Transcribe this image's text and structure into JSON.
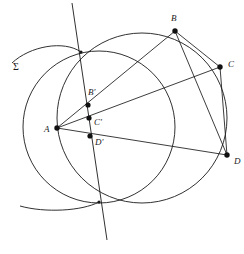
{
  "figure": {
    "width": 244,
    "height": 254,
    "stroke_color": "#1a1a1a",
    "background_color": "#ffffff",
    "point_color": "#111111"
  },
  "labels": {
    "sigma": "Σ",
    "A": "A",
    "B": "B",
    "C": "C",
    "D": "D",
    "Bp": "B'",
    "Cp": "C'",
    "Dp": "D'"
  },
  "points": {
    "A": {
      "x": 57,
      "y": 128,
      "label": "A",
      "label_x": 44,
      "label_y": 125,
      "marked": true
    },
    "B": {
      "x": 175,
      "y": 31,
      "label": "B",
      "label_x": 171,
      "label_y": 14,
      "marked": true
    },
    "C": {
      "x": 220,
      "y": 67,
      "label": "C",
      "label_x": 228,
      "label_y": 60,
      "marked": true
    },
    "D": {
      "x": 227,
      "y": 155,
      "label": "D",
      "label_x": 234,
      "label_y": 157,
      "marked": true
    },
    "Bp": {
      "x": 88,
      "y": 105,
      "label": "B'",
      "label_x": 88,
      "label_y": 88,
      "marked": true
    },
    "Cp": {
      "x": 89,
      "y": 118,
      "label": "C'",
      "label_x": 94,
      "label_y": 118,
      "marked": true
    },
    "Dp": {
      "x": 90,
      "y": 136,
      "label": "D'",
      "label_x": 95,
      "label_y": 138,
      "marked": true
    },
    "P_top": {
      "x": 81,
      "y": 52,
      "label": "",
      "marked": false
    },
    "P_bottom": {
      "x": 99,
      "y": 202,
      "label": "",
      "marked": false
    }
  },
  "circles": [
    {
      "name": "big-circle",
      "cx": 142,
      "cy": 118,
      "r": 85
    },
    {
      "name": "small-circle",
      "cx": 99,
      "cy": 127,
      "r": 76
    }
  ],
  "arcs": [
    {
      "name": "sigma-arc-upper",
      "d": "M 12 63 C 30 46, 64 40, 81 52",
      "label": "Σ",
      "label_x": 13,
      "label_y": 62
    },
    {
      "name": "sigma-arc-lower",
      "d": "M 20 206 C 45 213, 82 211, 99 202"
    }
  ],
  "segments": [
    {
      "name": "ray-A-to-B",
      "from": "A",
      "to": "B"
    },
    {
      "name": "ray-A-to-C",
      "from": "A",
      "to": "C"
    },
    {
      "name": "ray-A-to-D",
      "from": "A",
      "to": "D"
    },
    {
      "name": "chord-B-to-C",
      "from": "B",
      "to": "C"
    },
    {
      "name": "chord-B-to-D",
      "from": "B",
      "to": "D"
    },
    {
      "name": "chord-C-to-D",
      "from": "C",
      "to": "D"
    }
  ],
  "lines": [
    {
      "name": "radical-axis",
      "x1": 72,
      "y1": 3,
      "x2": 107,
      "y2": 240
    }
  ]
}
